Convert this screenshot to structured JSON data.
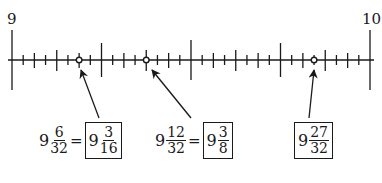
{
  "number_line": {
    "start_label": "9",
    "end_label": "10",
    "start_value": 9,
    "end_value": 10,
    "subdivisions": 32,
    "marked_points": [
      {
        "numerator": 6,
        "denominator": 32
      },
      {
        "numerator": 12,
        "denominator": 32
      },
      {
        "numerator": 27,
        "denominator": 32
      }
    ]
  },
  "labels": [
    {
      "whole": "9",
      "num": "6",
      "den": "32",
      "equals": "=",
      "simplified": {
        "whole": "9",
        "num": "3",
        "den": "16"
      }
    },
    {
      "whole": "9",
      "num": "12",
      "den": "32",
      "equals": "=",
      "simplified": {
        "whole": "9",
        "num": "3",
        "den": "8"
      }
    },
    {
      "boxed": {
        "whole": "9",
        "num": "27",
        "den": "32"
      }
    }
  ],
  "colors": {
    "ink": "#1a1a1a",
    "background": "#ffffff"
  }
}
